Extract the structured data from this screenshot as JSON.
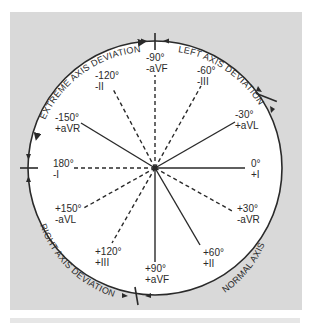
{
  "diagram": {
    "colors": {
      "background_box": "#d9d9d9",
      "circle_fill": "#ffffff",
      "line": "#2a2a2a",
      "text": "#2a2a2a"
    },
    "quadrants": [
      {
        "label": "EXTREME AXIS DEVIATION",
        "position": "upper-left"
      },
      {
        "label": "LEFT AXIS DEVIATION",
        "position": "upper-right"
      },
      {
        "label": "RIGHT AXIS DEVIATION",
        "position": "lower-left"
      },
      {
        "label": "NORMAL AXIS",
        "position": "lower-right"
      }
    ],
    "leads": [
      {
        "angle": "-90°",
        "lead": "-aVF",
        "style": "dashed"
      },
      {
        "angle": "-60°",
        "lead": "-III",
        "style": "dashed"
      },
      {
        "angle": "-30°",
        "lead": "+aVL",
        "style": "solid"
      },
      {
        "angle": "0°",
        "lead": "+I",
        "style": "solid"
      },
      {
        "angle": "+30°",
        "lead": "-aVR",
        "style": "dashed"
      },
      {
        "angle": "+60°",
        "lead": "+II",
        "style": "solid"
      },
      {
        "angle": "+90°",
        "lead": "+aVF",
        "style": "solid"
      },
      {
        "angle": "+120°",
        "lead": "+III",
        "style": "dashed"
      },
      {
        "angle": "+150°",
        "lead": "-aVL",
        "style": "dashed"
      },
      {
        "angle": "180°",
        "lead": "-I",
        "style": "dashed"
      },
      {
        "angle": "-150°",
        "lead": "+aVR",
        "style": "solid"
      },
      {
        "angle": "-120°",
        "lead": "-II",
        "style": "dashed"
      }
    ],
    "boundary_markers": [
      "-90°",
      "-30°",
      "180°",
      "+90°"
    ]
  }
}
